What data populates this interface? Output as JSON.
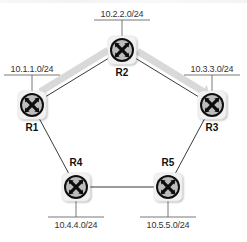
{
  "diagram": {
    "type": "network-topology",
    "topology": "ring",
    "colors": {
      "link": "#222222",
      "highlight_path": "#d9d9d9",
      "router_tile": "#f2f2f2",
      "router_ring": "#111111",
      "router_fill": "#bdbdbd",
      "router_glyph": "#111111",
      "subnet_bar": "#555555",
      "text": "#333333"
    },
    "routers": [
      {
        "id": "R1",
        "label": "R1",
        "x": 32,
        "y": 105,
        "subnet": "10.1.1.0/24",
        "subnet_side": "top"
      },
      {
        "id": "R2",
        "label": "R2",
        "x": 122,
        "y": 50,
        "subnet": "10.2.2.0/24",
        "subnet_side": "top"
      },
      {
        "id": "R3",
        "label": "R3",
        "x": 212,
        "y": 105,
        "subnet": "10.3.3.0/24",
        "subnet_side": "top"
      },
      {
        "id": "R4",
        "label": "R4",
        "x": 76,
        "y": 187,
        "subnet": "10.4.4.0/24",
        "subnet_side": "bottom"
      },
      {
        "id": "R5",
        "label": "R5",
        "x": 168,
        "y": 187,
        "subnet": "10.5.5.0/24",
        "subnet_side": "bottom"
      }
    ],
    "links": [
      {
        "from": "R1",
        "to": "R2"
      },
      {
        "from": "R2",
        "to": "R3"
      },
      {
        "from": "R3",
        "to": "R5"
      },
      {
        "from": "R5",
        "to": "R4"
      },
      {
        "from": "R4",
        "to": "R1"
      }
    ],
    "highlighted_path": {
      "hops": [
        "R1",
        "R2",
        "R3"
      ],
      "arrowhead_at": "R3"
    }
  }
}
